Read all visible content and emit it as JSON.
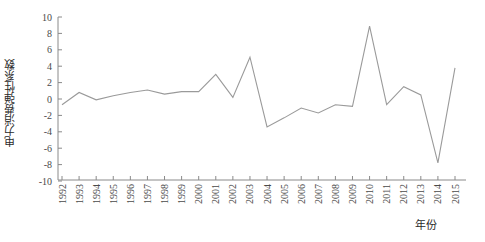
{
  "chart_data": {
    "type": "line",
    "title": "",
    "subtitle": "",
    "xlabel": "年份",
    "ylabel": "电力消费弹性系数",
    "xlim": [
      1992,
      2015
    ],
    "ylim": [
      -10,
      10
    ],
    "grid": false,
    "legend": null,
    "legend_position": "none",
    "yticks": [
      10,
      8,
      6,
      4,
      2,
      0,
      -2,
      -4,
      -6,
      -8,
      -10
    ],
    "ytick_labels": [
      "10",
      "8",
      "6",
      "4",
      "2",
      "0",
      "-2",
      "-4",
      "-6",
      "-8",
      "-10"
    ],
    "categories": [
      "1992",
      "1993",
      "1994",
      "1995",
      "1996",
      "1997",
      "1998",
      "1999",
      "2000",
      "2001",
      "2002",
      "2003",
      "2004",
      "2005",
      "2006",
      "2007",
      "2008",
      "2009",
      "2010",
      "2011",
      "2012",
      "2013",
      "2014",
      "2015"
    ],
    "x": [
      1992,
      1993,
      1994,
      1995,
      1996,
      1997,
      1998,
      1999,
      2000,
      2001,
      2002,
      2003,
      2004,
      2005,
      2006,
      2007,
      2008,
      2009,
      2010,
      2011,
      2012,
      2013,
      2014,
      2015
    ],
    "values": [
      -0.7,
      0.8,
      -0.1,
      0.4,
      0.8,
      1.1,
      0.6,
      0.9,
      0.9,
      3.0,
      0.2,
      5.1,
      -3.4,
      -2.3,
      -1.1,
      -1.7,
      -0.7,
      -0.9,
      8.9,
      -0.7,
      1.5,
      0.5,
      -7.8,
      3.8
    ],
    "series": [
      {
        "name": "电力消费弹性系数",
        "color": "#9a9a9a",
        "values": [
          -0.7,
          0.8,
          -0.1,
          0.4,
          0.8,
          1.1,
          0.6,
          0.9,
          0.9,
          3.0,
          0.2,
          5.1,
          -3.4,
          -2.3,
          -1.1,
          -1.7,
          -0.7,
          -0.9,
          8.9,
          -0.7,
          1.5,
          0.5,
          -7.8,
          3.8
        ]
      }
    ],
    "annotations": []
  },
  "axes": {
    "y_axis_label": "电力消费弹性系数",
    "x_axis_label": "年份"
  },
  "colors": {
    "line": "#9a9a9a",
    "axis": "#8a8a8a",
    "text": "#4a4a4a",
    "background": "#ffffff"
  }
}
